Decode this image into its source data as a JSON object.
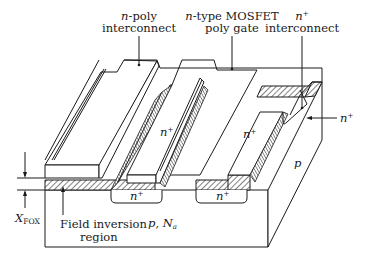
{
  "figure": {
    "type": "cross-section perspective diagram"
  },
  "labels": {
    "n_poly": {
      "italic": "n",
      "rest": "-poly",
      "line2": "interconnect"
    },
    "mosfet_gate": {
      "italic": "n",
      "rest": "-type MOSFET",
      "line2": "poly gate"
    },
    "nplus_interconnect": {
      "italic": "n",
      "sup": "+",
      "line2": "interconnect"
    },
    "nplus_right": {
      "italic": "n",
      "sup": "+"
    },
    "nplus_top_left": {
      "italic": "n",
      "sup": "+"
    },
    "nplus_top_mid": {
      "italic": "n",
      "sup": "+"
    },
    "nplus_bottom_left": {
      "italic": "n",
      "sup": "+"
    },
    "nplus_bottom_right": {
      "italic": "n",
      "sup": "+"
    },
    "p_side": {
      "italic": "p"
    },
    "substrate": {
      "italic_p": "p",
      "sep": ", ",
      "italic_N": "N",
      "sub": "a"
    },
    "xfox": {
      "italic": "X",
      "sub": "FOX"
    },
    "field_inversion": {
      "line1": "Field inversion",
      "line2": "region"
    }
  },
  "colors": {
    "line": "#1a1a1a",
    "background": "#ffffff"
  }
}
